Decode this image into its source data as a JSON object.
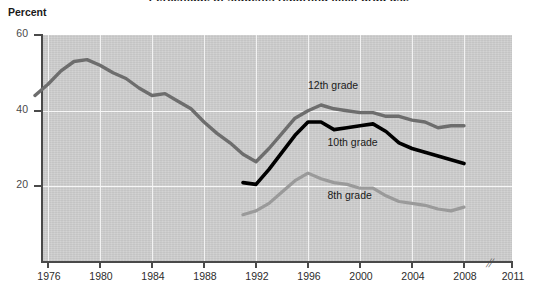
{
  "title": "Percentage of students reporting illicit drug use",
  "y_axis_label": "Percent",
  "axis_break_glyph": "//",
  "labels": {
    "grade12": "12th grade",
    "grade10": "10th grade",
    "grade8": "8th grade"
  },
  "colors": {
    "grade12": "#6d6d6d",
    "grade10": "#000000",
    "grade8": "#9a9a9a",
    "plot_background": "#cfcfcf",
    "gridline": "#f2f2f2",
    "axis": "#4a4a4a"
  },
  "chart_data": {
    "type": "line",
    "title": "Percentage of students reporting illicit drug use",
    "xlabel": "",
    "ylabel": "Percent",
    "xlim": [
      1975,
      2011
    ],
    "ylim": [
      0,
      60
    ],
    "yticks": [
      20,
      40,
      60
    ],
    "xticks": [
      1976,
      1980,
      1984,
      1988,
      1992,
      1996,
      2000,
      2004,
      2008,
      2011
    ],
    "grid": true,
    "legend": "inline-labels",
    "axis_break_after": 2008,
    "series": [
      {
        "name": "12th grade",
        "color": "#6d6d6d",
        "x": [
          1975,
          1976,
          1977,
          1978,
          1979,
          1980,
          1981,
          1982,
          1983,
          1984,
          1985,
          1986,
          1987,
          1988,
          1989,
          1990,
          1991,
          1992,
          1993,
          1994,
          1995,
          1996,
          1997,
          1998,
          1999,
          2000,
          2001,
          2002,
          2003,
          2004,
          2005,
          2006,
          2007,
          2008
        ],
        "values": [
          44.0,
          47.0,
          50.5,
          53.0,
          53.5,
          52.0,
          50.0,
          48.5,
          46.0,
          44.0,
          44.5,
          42.5,
          40.5,
          37.0,
          34.0,
          31.5,
          28.5,
          26.5,
          30.0,
          34.0,
          38.0,
          40.0,
          41.5,
          40.5,
          40.0,
          39.5,
          39.5,
          38.5,
          38.5,
          37.5,
          37.0,
          35.5,
          36.0,
          36.0
        ]
      },
      {
        "name": "10th grade",
        "color": "#000000",
        "x": [
          1991,
          1992,
          1993,
          1994,
          1995,
          1996,
          1997,
          1998,
          1999,
          2000,
          2001,
          2002,
          2003,
          2004,
          2005,
          2006,
          2007,
          2008
        ],
        "values": [
          21.0,
          20.5,
          24.5,
          29.0,
          33.5,
          37.0,
          37.0,
          35.0,
          35.5,
          36.0,
          36.5,
          34.5,
          31.5,
          30.0,
          29.0,
          28.0,
          27.0,
          26.0
        ]
      },
      {
        "name": "8th grade",
        "color": "#9a9a9a",
        "x": [
          1991,
          1992,
          1993,
          1994,
          1995,
          1996,
          1997,
          1998,
          1999,
          2000,
          2001,
          2002,
          2003,
          2004,
          2005,
          2006,
          2007,
          2008
        ],
        "values": [
          12.5,
          13.5,
          15.5,
          18.5,
          21.5,
          23.5,
          22.0,
          21.0,
          20.5,
          19.5,
          19.5,
          17.5,
          16.0,
          15.5,
          15.0,
          14.0,
          13.5,
          14.5
        ]
      }
    ],
    "annotations": [
      {
        "text": "12th grade",
        "x": 1996.0,
        "y": 46.5
      },
      {
        "text": "10th grade",
        "x": 1997.5,
        "y": 31.5
      },
      {
        "text": "8th grade",
        "x": 1997.5,
        "y": 17.5
      }
    ]
  }
}
